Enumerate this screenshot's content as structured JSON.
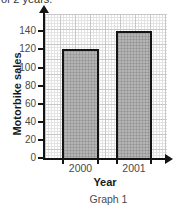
{
  "page": {
    "top_text": "of 2 years.",
    "caption": "Graph 1"
  },
  "chart_data": {
    "type": "bar",
    "title": "",
    "categories": [
      "2000",
      "2001"
    ],
    "values": [
      120,
      140
    ],
    "xlabel": "Year",
    "ylabel": "Motorbike sales",
    "ylim": [
      0,
      140
    ],
    "ytick_step": 20,
    "yticks": [
      0,
      20,
      40,
      60,
      80,
      100,
      120,
      140
    ],
    "grid": "fine graph-paper grid, on",
    "legend": "none",
    "colors": {
      "bar_fill": "#b4b4b4",
      "bar_border": "#141414",
      "axis": "#141414",
      "tick_label": "#4a4a4a",
      "grid_minor": "#e3e3e3",
      "grid_major": "#c7c7c7"
    }
  }
}
